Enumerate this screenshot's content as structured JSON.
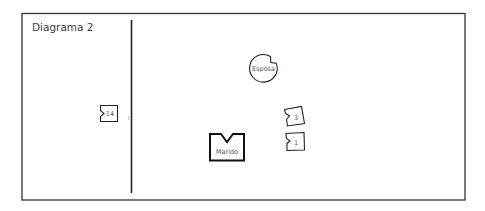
{
  "diagram": {
    "title": "Diagrama 2",
    "nodes": [
      {
        "id": "esposa",
        "label": "Esposa",
        "shape": "circle-notched"
      },
      {
        "id": "marido",
        "label": "Marido",
        "shape": "square-notched-bold"
      },
      {
        "id": "n3",
        "label": "3",
        "shape": "square-notched"
      },
      {
        "id": "n1",
        "label": "1",
        "shape": "square-notched"
      },
      {
        "id": "n14",
        "label": "14",
        "shape": "square-notched"
      }
    ],
    "divider": "vertical-line",
    "colors": {
      "stroke": "#222222",
      "text": "#444444",
      "background": "#ffffff"
    }
  }
}
